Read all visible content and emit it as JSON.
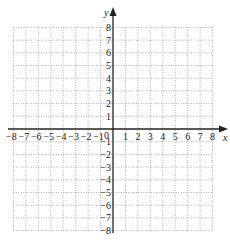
{
  "chart_data": {
    "type": "scatter",
    "title": "",
    "xlabel": "x",
    "ylabel": "y",
    "xlim": [
      -8,
      8
    ],
    "ylim": [
      -8,
      8
    ],
    "grid": true,
    "grid_style": "dotted",
    "x_ticks": [
      "-8",
      "-7",
      "-6",
      "-5",
      "-4",
      "-3",
      "-2",
      "-1",
      "0",
      "1",
      "2",
      "3",
      "4",
      "5",
      "6",
      "7",
      "8"
    ],
    "y_ticks": [
      "-8",
      "-7",
      "-6",
      "-5",
      "-4",
      "-3",
      "-2",
      "-1",
      "1",
      "2",
      "3",
      "4",
      "5",
      "6",
      "7",
      "8"
    ],
    "series": [],
    "colors": {
      "axis": "#222222",
      "grid": "#9a9a9a",
      "text": "#222222"
    }
  },
  "labels": {
    "x_axis": "x",
    "y_axis": "y",
    "origin": "0"
  }
}
